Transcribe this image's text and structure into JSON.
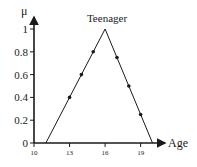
{
  "chart_data": {
    "type": "line",
    "title": "Teenager",
    "xlabel": "Age",
    "ylabel": "μ",
    "x_ticks": [
      10,
      13,
      16,
      19
    ],
    "y_ticks": [
      0,
      0.2,
      0.4,
      0.6,
      0.8,
      1
    ],
    "y_tick_labels": [
      "0",
      "0.2",
      "0.4",
      "0.6",
      "0.8",
      "1"
    ],
    "x_tick_labels": [
      "10",
      "13",
      "16",
      "19"
    ],
    "xlim": [
      10,
      21
    ],
    "ylim": [
      0,
      1.1
    ],
    "grid": false,
    "legend": null,
    "series": [
      {
        "name": "Teenager membership function",
        "x": [
          11,
          16,
          20
        ],
        "y": [
          0,
          1,
          0
        ],
        "style": "line"
      },
      {
        "name": "Sample points",
        "x": [
          13,
          14,
          15,
          17,
          18,
          19
        ],
        "y": [
          0.4,
          0.6,
          0.8,
          0.75,
          0.5,
          0.25
        ],
        "style": "markers"
      }
    ]
  },
  "colors": {
    "line": "#1a1a1a",
    "axis": "#1a1a1a",
    "background": "#ffffff"
  }
}
